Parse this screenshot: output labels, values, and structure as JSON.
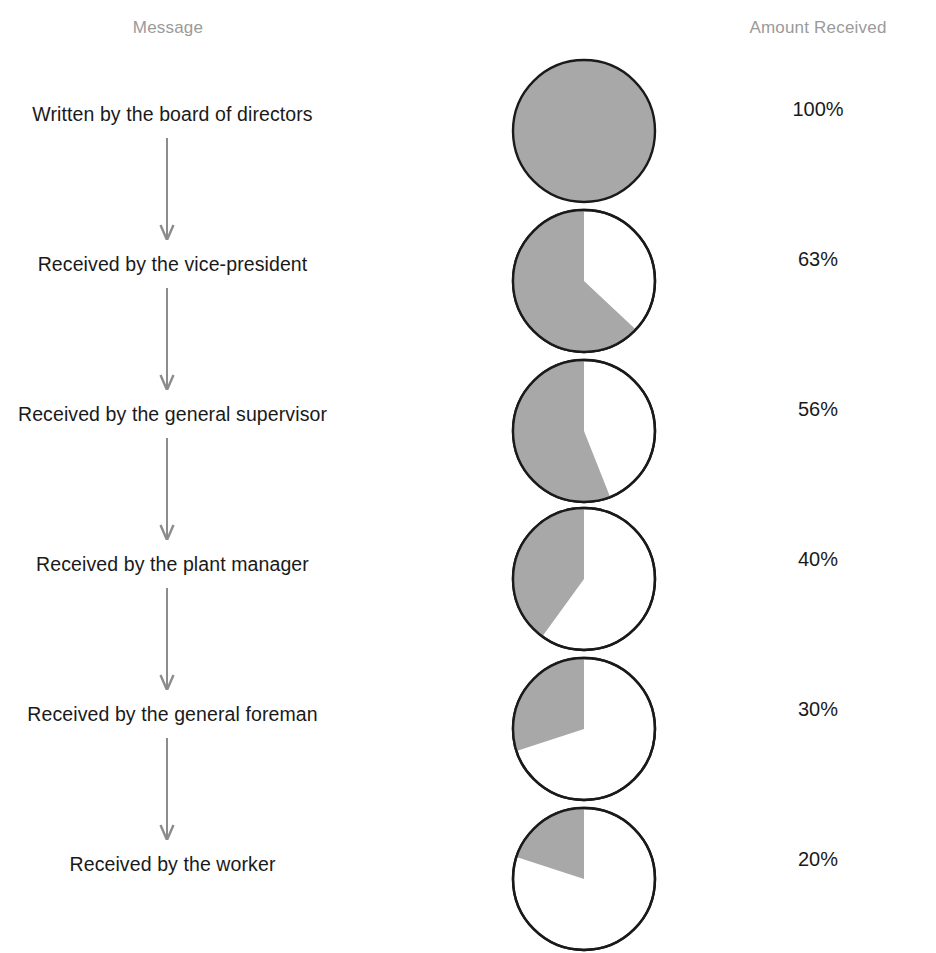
{
  "headers": {
    "message": "Message",
    "amount": "Amount Received"
  },
  "colors": {
    "header_text": "#9a9a9a",
    "body_text": "#1a1a1a",
    "pie_fill": "#a8a8a8",
    "pie_empty": "#ffffff",
    "pie_stroke": "#1a1a1a",
    "arrow": "#8c8c8c",
    "background": "#ffffff"
  },
  "chart_data": {
    "type": "pie",
    "title": "Message",
    "xlabel": "",
    "ylabel": "Amount Received",
    "categories": [
      "Written by the board of directors",
      "Received by the vice-president",
      "Received by the general supervisor",
      "Received by the plant manager",
      "Received by the general foreman",
      "Received by the worker"
    ],
    "values": [
      100,
      63,
      56,
      40,
      30,
      20
    ],
    "value_labels": [
      "100%",
      "63%",
      "56%",
      "40%",
      "30%",
      "20%"
    ],
    "legend": [],
    "grid": false
  },
  "rows": [
    {
      "label": "Written by the board of directors",
      "percent": 100,
      "amount": "100%"
    },
    {
      "label": "Received by the vice-president",
      "percent": 63,
      "amount": "63%"
    },
    {
      "label": "Received by the general supervisor",
      "percent": 56,
      "amount": "56%"
    },
    {
      "label": "Received by the plant manager",
      "percent": 40,
      "amount": "40%"
    },
    {
      "label": "Received by the general foreman",
      "percent": 30,
      "amount": "30%"
    },
    {
      "label": "Received by the worker",
      "percent": 20,
      "amount": "20%"
    }
  ]
}
